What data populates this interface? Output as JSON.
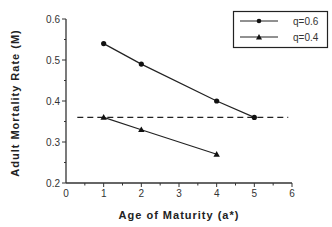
{
  "chart_data": {
    "type": "line",
    "title": "",
    "xlabel": "Age  of  Maturity  (a*)",
    "ylabel": "Adult  Mortality  Rate  (M)",
    "xlim": [
      0,
      6
    ],
    "ylim": [
      0.2,
      0.6
    ],
    "xticks": [
      0,
      1,
      2,
      3,
      4,
      5,
      6
    ],
    "xtick_labels": [
      "0",
      "1",
      "2",
      "3",
      "4",
      "5",
      "6"
    ],
    "yticks": [
      0.2,
      0.3,
      0.4,
      0.5,
      0.6
    ],
    "ytick_labels": [
      "0.2",
      "0.3",
      "0.4",
      "0.5",
      "0.6"
    ],
    "grid": false,
    "legend_position": "upper right",
    "series": [
      {
        "name": "q=0.6",
        "marker": "circle",
        "x": [
          1,
          2,
          4,
          5
        ],
        "values": [
          0.54,
          0.49,
          0.4,
          0.36
        ]
      },
      {
        "name": "q=0.4",
        "marker": "triangle",
        "x": [
          1,
          2,
          4
        ],
        "values": [
          0.36,
          0.33,
          0.27
        ]
      }
    ],
    "reference_line": {
      "style": "dashed",
      "y": 0.36,
      "x_start": 0.3,
      "x_end": 5.9
    }
  },
  "legend": {
    "items": [
      {
        "label": "q=0.6",
        "marker": "circle"
      },
      {
        "label": "q=0.4",
        "marker": "triangle"
      }
    ]
  },
  "colors": {
    "line": "#222222",
    "axis": "#333333",
    "background": "#ffffff"
  }
}
